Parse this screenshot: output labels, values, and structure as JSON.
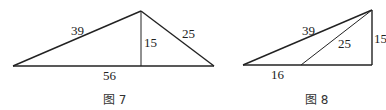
{
  "figures": [
    {
      "caption": "图 7",
      "labels": {
        "hyp_left": "39",
        "altitude": "15",
        "hyp_right": "25",
        "base": "56"
      }
    },
    {
      "caption": "图 8",
      "labels": {
        "hyp_outer": "39",
        "hyp_inner": "25",
        "vertical": "15",
        "base_segment": "16"
      }
    }
  ]
}
